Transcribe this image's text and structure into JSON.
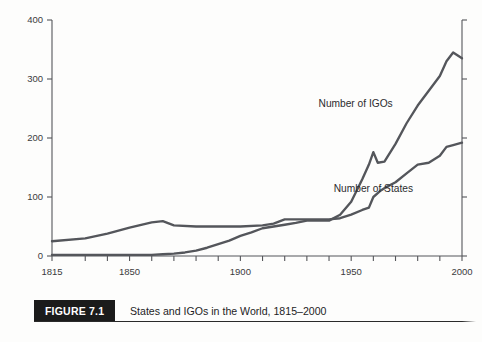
{
  "figure": {
    "badge": "FIGURE 7.1",
    "caption": "States and IGOs in the World, 1815–2000"
  },
  "chart_data": {
    "type": "line",
    "title": "States and IGOs in the World, 1815–2000",
    "xlabel": "",
    "ylabel": "",
    "xlim": [
      1815,
      2000
    ],
    "ylim": [
      0,
      400
    ],
    "yticks": [
      0,
      100,
      200,
      300,
      400
    ],
    "ytick_labels": [
      "0",
      "100",
      "200",
      "300",
      "400"
    ],
    "xticks": [
      1815,
      1830,
      1840,
      1850,
      1860,
      1870,
      1880,
      1890,
      1900,
      1910,
      1920,
      1930,
      1940,
      1950,
      1960,
      1970,
      1980,
      1990,
      2000
    ],
    "xtick_labels_shown": [
      "1815",
      "1850",
      "1900",
      "1950",
      "2000"
    ],
    "xtick_labels_shown_values": [
      1815,
      1850,
      1900,
      1950,
      2000
    ],
    "grid": false,
    "legend_position": "inline-annotations",
    "series": [
      {
        "name": "Number of IGOs",
        "label_x": 1952,
        "label_y": 252,
        "x": [
          1815,
          1830,
          1840,
          1850,
          1860,
          1865,
          1870,
          1875,
          1880,
          1885,
          1890,
          1895,
          1900,
          1905,
          1910,
          1915,
          1920,
          1925,
          1930,
          1935,
          1940,
          1945,
          1950,
          1955,
          1958,
          1960,
          1962,
          1965,
          1970,
          1975,
          1980,
          1985,
          1990,
          1993,
          1996,
          2000
        ],
        "y": [
          2,
          2,
          2,
          2,
          2,
          3,
          4,
          6,
          9,
          14,
          20,
          26,
          34,
          40,
          47,
          50,
          53,
          56,
          60,
          60,
          60,
          70,
          92,
          130,
          155,
          176,
          158,
          160,
          190,
          225,
          255,
          280,
          305,
          330,
          345,
          335
        ]
      },
      {
        "name": "Number of States",
        "label_x": 1960,
        "label_y": 108,
        "x": [
          1815,
          1830,
          1840,
          1850,
          1860,
          1865,
          1870,
          1880,
          1890,
          1900,
          1910,
          1915,
          1920,
          1925,
          1930,
          1935,
          1940,
          1945,
          1950,
          1955,
          1958,
          1960,
          1963,
          1965,
          1970,
          1975,
          1980,
          1985,
          1990,
          1993,
          1996,
          2000
        ],
        "y": [
          25,
          30,
          38,
          48,
          57,
          59,
          52,
          50,
          50,
          50,
          52,
          55,
          62,
          62,
          62,
          62,
          62,
          64,
          70,
          78,
          82,
          100,
          110,
          115,
          125,
          140,
          155,
          158,
          170,
          185,
          188,
          192
        ]
      }
    ]
  }
}
